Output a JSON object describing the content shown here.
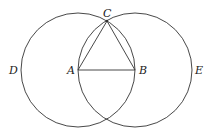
{
  "diagram": {
    "points": {
      "A": {
        "label": "A",
        "x": 78,
        "y": 70
      },
      "B": {
        "label": "B",
        "x": 135,
        "y": 70
      },
      "C": {
        "label": "C",
        "x": 107,
        "y": 21
      },
      "D": {
        "label": "D"
      },
      "E": {
        "label": "E"
      }
    },
    "circles": [
      {
        "name": "circle-centered-A",
        "cx": 78,
        "cy": 70,
        "r": 57
      },
      {
        "name": "circle-centered-B",
        "cx": 135,
        "cy": 70,
        "r": 57
      }
    ],
    "segments": [
      "AB",
      "AC",
      "BC"
    ],
    "stroke_color": "#333333"
  }
}
